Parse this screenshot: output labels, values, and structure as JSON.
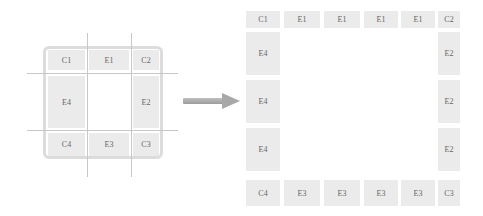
{
  "left_diagram": {
    "cells": [
      {
        "label": "C1",
        "x": 48,
        "y": 50,
        "w": 37,
        "h": 20
      },
      {
        "label": "E1",
        "x": 89,
        "y": 50,
        "w": 40,
        "h": 20
      },
      {
        "label": "C2",
        "x": 133,
        "y": 50,
        "w": 26,
        "h": 20
      },
      {
        "label": "E4",
        "x": 48,
        "y": 76,
        "w": 37,
        "h": 52
      },
      {
        "label": "E2",
        "x": 133,
        "y": 76,
        "w": 26,
        "h": 52
      },
      {
        "label": "C4",
        "x": 48,
        "y": 133,
        "w": 37,
        "h": 23
      },
      {
        "label": "E3",
        "x": 89,
        "y": 133,
        "w": 40,
        "h": 23
      },
      {
        "label": "C3",
        "x": 133,
        "y": 133,
        "w": 26,
        "h": 23
      }
    ],
    "grid_lines": {
      "vertical_x": [
        87,
        131
      ],
      "vertical_y_range": [
        33,
        177
      ],
      "horizontal_y": [
        73,
        130
      ],
      "horizontal_x_range": [
        27,
        178
      ]
    }
  },
  "arrow": {
    "direction": "right",
    "from_x": 183,
    "to_x": 240,
    "y": 101
  },
  "right_diagram": {
    "top_row": [
      "C1",
      "E1",
      "E1",
      "E1",
      "E1",
      "C2"
    ],
    "left_column": [
      "E4",
      "E4",
      "E4"
    ],
    "right_column": [
      "E2",
      "E2",
      "E2"
    ],
    "bottom_row": [
      "C4",
      "E3",
      "E3",
      "E3",
      "E3",
      "C3"
    ]
  }
}
